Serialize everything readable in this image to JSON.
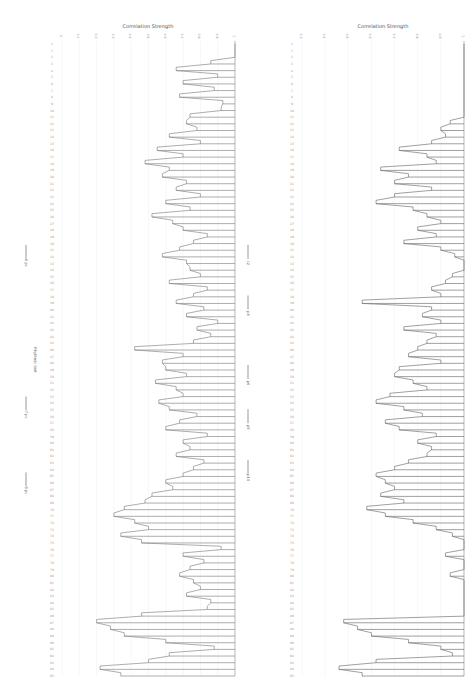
{
  "chart_data": [
    {
      "type": "line",
      "panel": "left",
      "title": "",
      "xlabel": "Correlation Strength",
      "ylabel": "Rhythmic Unit",
      "xlim": [
        0,
        1
      ],
      "x_ticks": [
        "0",
        "0.1",
        "0.2",
        "0.3",
        "0.4",
        "0.5",
        "0.6",
        "0.7",
        "0.8",
        "0.9",
        "1"
      ],
      "grid": true,
      "annotations": [
        {
          "label": "6 pc",
          "row_fraction": 0.34
        },
        {
          "label": "7 pc",
          "row_fraction": 0.58
        },
        {
          "label": "8 pc",
          "row_fraction": 0.7
        }
      ],
      "row_count": 96,
      "series": [
        {
          "name": "correlation",
          "color": "#8a8a8a",
          "values": [
            1,
            1,
            1,
            0.86,
            0.66,
            0.9,
            0.7,
            0.88,
            0.68,
            0.93,
            0.92,
            0.74,
            0.72,
            0.78,
            0.62,
            0.8,
            0.55,
            0.7,
            0.48,
            0.62,
            0.58,
            0.72,
            0.66,
            0.8,
            0.6,
            0.74,
            0.52,
            0.64,
            0.7,
            0.84,
            0.76,
            0.68,
            0.58,
            0.72,
            0.74,
            0.8,
            0.62,
            0.84,
            0.76,
            0.66,
            0.82,
            0.72,
            0.9,
            0.78,
            0.86,
            0.76,
            0.42,
            0.7,
            0.58,
            0.6,
            0.72,
            0.54,
            0.66,
            0.7,
            0.56,
            0.62,
            0.78,
            0.68,
            0.6,
            0.84,
            0.7,
            0.74,
            0.66,
            0.82,
            0.76,
            0.7,
            0.6,
            0.64,
            0.52,
            0.48,
            0.36,
            0.3,
            0.42,
            0.5,
            0.34,
            0.46,
            0.92,
            0.7,
            0.82,
            0.74,
            0.68,
            0.76,
            0.8,
            0.72,
            0.86,
            0.84,
            0.46,
            0.2,
            0.28,
            0.36,
            0.6,
            0.88,
            0.62,
            0.5,
            0.22,
            0.34
          ]
        }
      ]
    },
    {
      "type": "line",
      "panel": "right",
      "title": "",
      "xlabel": "Correlation Strength",
      "ylabel": "",
      "xlim": [
        0.3,
        1
      ],
      "x_ticks": [
        "0.3",
        "0.4",
        "0.5",
        "0.6",
        "0.7",
        "0.8",
        "0.9",
        "1"
      ],
      "grid": true,
      "annotations": [
        {
          "label": "c2",
          "row_fraction": 0.34
        },
        {
          "label": "p4",
          "row_fraction": 0.42
        },
        {
          "label": "p6",
          "row_fraction": 0.53
        },
        {
          "label": "p8",
          "row_fraction": 0.6
        },
        {
          "label": "p10",
          "row_fraction": 0.68
        }
      ],
      "row_count": 96,
      "series": [
        {
          "name": "correlation",
          "color": "#777777",
          "values": [
            1,
            1,
            1,
            1,
            1,
            1,
            1,
            1,
            1,
            1,
            1,
            1,
            0.94,
            0.9,
            0.92,
            0.86,
            0.72,
            0.84,
            0.88,
            0.64,
            0.76,
            0.7,
            0.86,
            0.7,
            0.62,
            0.78,
            0.84,
            0.9,
            0.8,
            0.88,
            0.74,
            0.9,
            0.96,
            1,
            1,
            0.95,
            0.92,
            0.86,
            0.9,
            0.56,
            0.86,
            0.82,
            0.9,
            0.74,
            0.88,
            0.84,
            0.8,
            0.76,
            0.9,
            0.72,
            0.7,
            0.78,
            0.84,
            0.68,
            0.62,
            0.74,
            0.82,
            0.66,
            0.72,
            0.88,
            0.8,
            0.86,
            0.84,
            0.76,
            0.7,
            0.62,
            0.66,
            0.7,
            0.64,
            0.74,
            0.58,
            0.66,
            0.78,
            0.88,
            0.95,
            1,
            1,
            0.92,
            1,
            1,
            0.94,
            1,
            1,
            1,
            1,
            1,
            1,
            0.48,
            0.54,
            0.6,
            0.76,
            0.9,
            0.95,
            0.62,
            0.46,
            0.56
          ]
        }
      ]
    }
  ],
  "row_labels_caption": "Rhythmic Unit"
}
